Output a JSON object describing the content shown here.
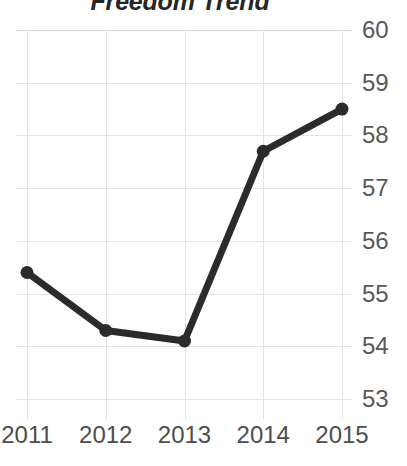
{
  "chart_data": {
    "type": "line",
    "title": "Freedom Trend",
    "subtitle": "",
    "xlabel": "",
    "ylabel": "",
    "categories": [
      "2011",
      "2012",
      "2013",
      "2014",
      "2015"
    ],
    "x": [
      2011,
      2012,
      2013,
      2014,
      2015
    ],
    "values": [
      55.4,
      54.3,
      54.1,
      57.7,
      58.5
    ],
    "series": [
      {
        "name": "Freedom Trend",
        "values": [
          55.4,
          54.3,
          54.1,
          57.7,
          58.5
        ],
        "color": "#2b2b2b"
      }
    ],
    "ylim": [
      53,
      60
    ],
    "yticks": [
      53,
      54,
      55,
      56,
      57,
      58,
      59,
      60
    ],
    "ytick_labels": [
      "53",
      "54",
      "55",
      "56",
      "57",
      "58",
      "59",
      "60"
    ],
    "xtick_labels": [
      "2011",
      "2012",
      "2013",
      "2014",
      "2015"
    ],
    "y_axis_position": "right",
    "grid": true,
    "grid_color": "#e3e3e3",
    "legend": false,
    "legend_position": "none",
    "marker": "circle",
    "line_color": "#2b2b2b",
    "background_color": "#ffffff",
    "title_color": "#262626",
    "tick_label_color": "#4d4d4d",
    "annotations": []
  },
  "axis": {
    "y_labels": [
      "60",
      "59",
      "58",
      "57",
      "56",
      "55",
      "54",
      "53"
    ],
    "x_labels": [
      "2011",
      "2012",
      "2013",
      "2014",
      "2015"
    ]
  }
}
